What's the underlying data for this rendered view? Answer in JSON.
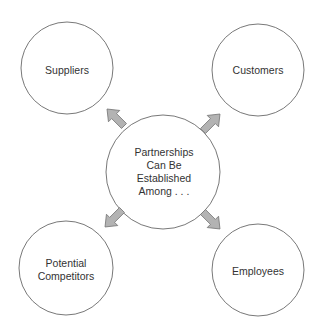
{
  "diagram": {
    "center": {
      "label_lines": [
        "Partnerships",
        "Can Be",
        "Established",
        "Among . . ."
      ]
    },
    "nodes": [
      {
        "id": "suppliers",
        "label_lines": [
          "Suppliers"
        ]
      },
      {
        "id": "customers",
        "label_lines": [
          "Customers"
        ]
      },
      {
        "id": "potential-competitors",
        "label_lines": [
          "Potential",
          "Competitors"
        ]
      },
      {
        "id": "employees",
        "label_lines": [
          "Employees"
        ]
      }
    ],
    "colors": {
      "circle_stroke": "#555555",
      "arrow_fill": "#b3b3b3",
      "arrow_stroke": "#777777",
      "text": "#333333"
    }
  }
}
